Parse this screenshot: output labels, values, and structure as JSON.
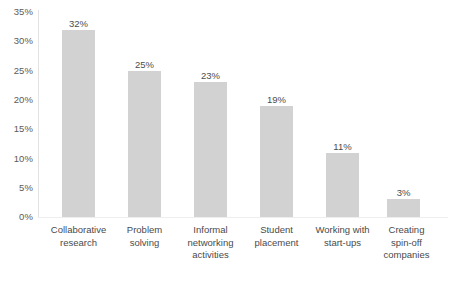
{
  "chart_data": {
    "type": "bar",
    "title": "",
    "subtitle": "",
    "xlabel": "",
    "ylabel": "",
    "ylim": [
      0,
      35
    ],
    "yticks": [
      0,
      5,
      10,
      15,
      20,
      25,
      30,
      35
    ],
    "ytick_labels": [
      "0%",
      "5%",
      "10%",
      "15%",
      "20%",
      "25%",
      "30%",
      "35%"
    ],
    "grid": false,
    "legend": false,
    "legend_position": "none",
    "value_suffix": "%",
    "bar_color": "#d2d2d2",
    "text_color": "#4a4a4a",
    "axis_color": "#e2e2e2",
    "categories": [
      "Collaborative research",
      "Problem solving",
      "Informal networking activities",
      "Student placement",
      "Working with start-ups",
      "Creating spin-off companies"
    ],
    "category_lines": [
      [
        "Collaborative",
        "research"
      ],
      [
        "Problem",
        "solving"
      ],
      [
        "Informal",
        "networking",
        "activities"
      ],
      [
        "Student",
        "placement"
      ],
      [
        "Working with",
        "start-ups"
      ],
      [
        "Creating",
        "spin-off",
        "companies"
      ]
    ],
    "values": [
      32,
      25,
      23,
      19,
      11,
      3
    ],
    "value_labels": [
      "32%",
      "25%",
      "23%",
      "19%",
      "11%",
      "3%"
    ]
  }
}
